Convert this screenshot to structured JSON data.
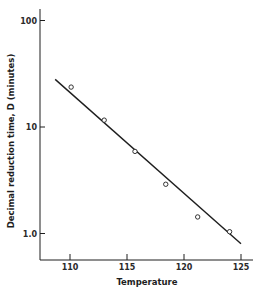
{
  "chart_data": {
    "type": "scatter",
    "title": "",
    "xlabel": "Temperature",
    "ylabel": "Decimal reduction time, D (minutes)",
    "xlim": [
      107.4,
      126.3
    ],
    "ylim": [
      0.57,
      124
    ],
    "yscale": "log",
    "grid": false,
    "legend": null,
    "x_ticks": [
      110,
      115,
      120,
      125
    ],
    "x_tick_labels": [
      "110",
      "115",
      "120",
      "125"
    ],
    "y_ticks": [
      100,
      10,
      1.0
    ],
    "y_tick_labels": [
      "100",
      "10",
      "1.0"
    ],
    "series": [
      {
        "name": "Observed D values",
        "type": "scatter",
        "marker": "open-circle",
        "x": [
          110.1,
          113.0,
          115.7,
          118.4,
          121.2,
          124.0
        ],
        "y": [
          23.7,
          11.6,
          5.9,
          2.9,
          1.43,
          1.04
        ]
      },
      {
        "name": "Fitted line",
        "type": "line",
        "x": [
          108.7,
          125.0
        ],
        "y": [
          28.0,
          0.8
        ]
      }
    ]
  },
  "colors": {
    "ink": "#1e1e1e",
    "background": "#ffffff"
  }
}
